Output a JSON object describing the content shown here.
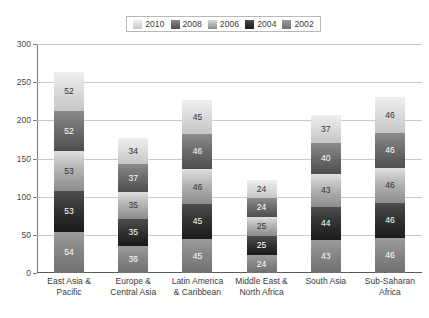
{
  "chart_data": {
    "type": "bar",
    "subtype": "stacked-vertical",
    "title": "",
    "xlabel": "",
    "ylabel": "",
    "ylim": [
      0,
      300
    ],
    "ytick_values": [
      0,
      50,
      100,
      150,
      200,
      250,
      300
    ],
    "ytick_labels": [
      "0",
      "50",
      "100",
      "150",
      "200",
      "250",
      "300"
    ],
    "ystep": 50,
    "grid": true,
    "grid_axis": "y",
    "legend_position": "top-center",
    "stack_order_top_to_bottom": [
      "2010",
      "2008",
      "2006",
      "2004",
      "2002"
    ],
    "categories": [
      "East Asia & Pacific",
      "Europe & Central Asia",
      "Latin America & Caribbean",
      "Middle East & North Africa",
      "South Asia",
      "Sub-Saharan Africa"
    ],
    "category_lines": [
      [
        "East Asia &",
        "Pacific"
      ],
      [
        "Europe &",
        "Central Asia"
      ],
      [
        "Latin America",
        "& Caribbean"
      ],
      [
        "Middle East &",
        "North Africa"
      ],
      [
        "South Asia",
        ""
      ],
      [
        "Sub-Saharan",
        "Africa"
      ]
    ],
    "series": [
      {
        "name": "2002",
        "color": "#868686",
        "values": [
          54,
          36,
          45,
          24,
          43,
          46
        ]
      },
      {
        "name": "2004",
        "color": "#333333",
        "values": [
          53,
          35,
          45,
          25,
          44,
          46
        ]
      },
      {
        "name": "2006",
        "color": "#b4b4b4",
        "values": [
          53,
          35,
          46,
          25,
          43,
          46
        ]
      },
      {
        "name": "2008",
        "color": "#6e6e6e",
        "values": [
          52,
          37,
          46,
          24,
          40,
          46
        ]
      },
      {
        "name": "2010",
        "color": "#dcdcdc",
        "values": [
          52,
          34,
          45,
          24,
          37,
          46
        ]
      }
    ],
    "totals": [
      264,
      177,
      227,
      122,
      207,
      230
    ]
  },
  "legend": {
    "items": [
      {
        "label": "2010",
        "swatch": "fill-2010"
      },
      {
        "label": "2008",
        "swatch": "fill-2008"
      },
      {
        "label": "2006",
        "swatch": "fill-2006"
      },
      {
        "label": "2004",
        "swatch": "fill-2004"
      },
      {
        "label": "2002",
        "swatch": "fill-2002"
      }
    ]
  },
  "caption": {
    "text": ""
  },
  "colors": {
    "axis": "#5a5a5a",
    "gridline": "#c9c9c9",
    "tick_text": "#4a4a4a",
    "label_text": "#3a3a3a",
    "background": "#ffffff"
  }
}
